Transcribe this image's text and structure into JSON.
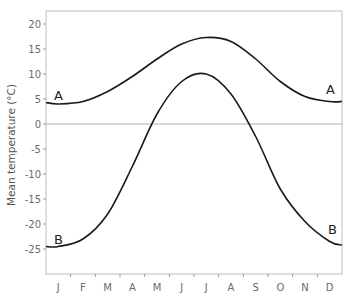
{
  "chart_data": {
    "type": "line",
    "title": "",
    "xlabel": "",
    "ylabel": "Mean temperature (°C)",
    "categories": [
      "J",
      "F",
      "M",
      "A",
      "M",
      "J",
      "J",
      "A",
      "S",
      "O",
      "N",
      "D"
    ],
    "yticks": [
      20,
      15,
      10,
      5,
      0,
      -5,
      -10,
      -15,
      -20,
      -25
    ],
    "ylim": [
      -30,
      23
    ],
    "grid": false,
    "zero_line": true,
    "legend": "inline labels at both ends of each curve",
    "series": [
      {
        "name": "A",
        "values": [
          4,
          4.5,
          6.5,
          9.5,
          13,
          16,
          17.3,
          16.5,
          13,
          8.5,
          5.5,
          4.5
        ],
        "start_value": 4.3,
        "end_value": 4.5
      },
      {
        "name": "B",
        "values": [
          -24.5,
          -23,
          -18,
          -8.5,
          2,
          8.5,
          10,
          6,
          -2.5,
          -13,
          -19.5,
          -23.5
        ],
        "start_value": -24.5,
        "end_value": -24.2
      }
    ]
  },
  "labels": {
    "y_axis_title": "Mean temperature (°C)",
    "series_a_left": "A",
    "series_a_right": "A",
    "series_b_left": "B",
    "series_b_right": "B"
  },
  "colors": {
    "line": "#1a1a1a",
    "axis": "#9a9a9a",
    "zero_line": "#b0b0b0",
    "text": "#6b6b6b"
  }
}
